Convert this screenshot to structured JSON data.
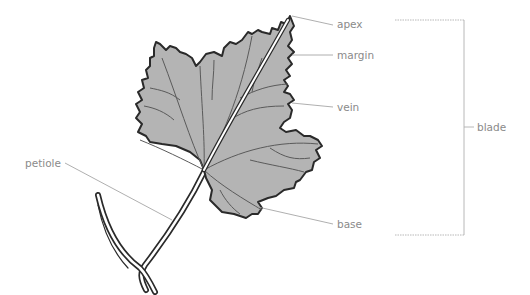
{
  "diagram": {
    "colors": {
      "leaf_fill": "#b4b4b4",
      "leaf_outline": "#2a2a2a",
      "vein": "#5a5a5a",
      "midrib": "#ffffff",
      "leader_line": "#9a9a9a",
      "label_text": "#8a8a8a",
      "bracket": "#b0b0b0"
    },
    "labels": {
      "apex": "apex",
      "margin": "margin",
      "vein": "vein",
      "petiole": "petiole",
      "base": "base",
      "blade": "blade"
    }
  }
}
